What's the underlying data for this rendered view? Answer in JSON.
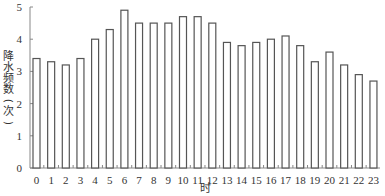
{
  "chart_data": {
    "type": "bar",
    "title": "",
    "xlabel": "时",
    "ylabel": "降水频数(次)",
    "ylim": [
      0,
      5
    ],
    "yticks": [
      0,
      1,
      2,
      3,
      4,
      5
    ],
    "grid": false,
    "legend": null,
    "categories": [
      "0",
      "1",
      "2",
      "3",
      "4",
      "5",
      "6",
      "7",
      "8",
      "9",
      "10",
      "11",
      "12",
      "13",
      "14",
      "15",
      "16",
      "17",
      "18",
      "19",
      "20",
      "21",
      "22",
      "23"
    ],
    "values": [
      3.4,
      3.3,
      3.2,
      3.4,
      4.0,
      4.3,
      4.9,
      4.5,
      4.5,
      4.5,
      4.7,
      4.7,
      4.5,
      3.9,
      3.8,
      3.9,
      4.0,
      4.1,
      3.8,
      3.3,
      3.6,
      3.2,
      2.9,
      2.7
    ],
    "bar_style": {
      "fill": "#ffffff",
      "stroke": "#555555"
    }
  }
}
